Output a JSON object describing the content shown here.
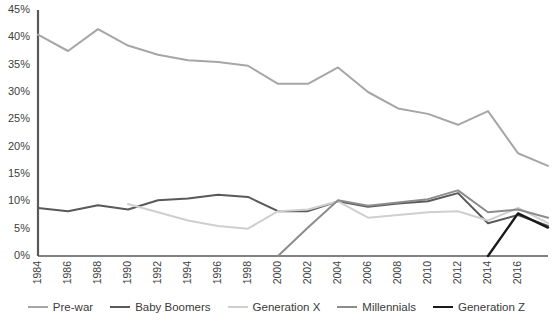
{
  "chart_data": {
    "type": "line",
    "title": "",
    "subtitle": "",
    "xlabel": "",
    "ylabel": "",
    "xlim": [
      1984,
      2018
    ],
    "ylim": [
      0,
      45
    ],
    "grid": false,
    "legend_position": "bottom",
    "y_ticks": [
      "0%",
      "5%",
      "10%",
      "15%",
      "20%",
      "25%",
      "30%",
      "35%",
      "40%",
      "45%"
    ],
    "y_tick_values": [
      0,
      5,
      10,
      15,
      20,
      25,
      30,
      35,
      40,
      45
    ],
    "x_ticks": [
      "1984",
      "1986",
      "1988",
      "1990",
      "1992",
      "1994",
      "1996",
      "1998",
      "2000",
      "2002",
      "2004",
      "2006",
      "2008",
      "2010",
      "2012",
      "2014",
      "2016"
    ],
    "x_tick_values": [
      1984,
      1986,
      1988,
      1990,
      1992,
      1994,
      1996,
      1998,
      2000,
      2002,
      2004,
      2006,
      2008,
      2010,
      2012,
      2014,
      2016
    ],
    "series": [
      {
        "name": "Pre-war",
        "color": "#a6a6a6",
        "width": 2.0,
        "x": [
          1984,
          1986,
          1988,
          1990,
          1992,
          1994,
          1996,
          1998,
          2000,
          2002,
          2004,
          2006,
          2008,
          2010,
          2012,
          2014,
          2016,
          2018
        ],
        "values": [
          40.5,
          37.5,
          41.5,
          38.5,
          36.8,
          35.8,
          35.5,
          34.8,
          31.5,
          31.5,
          34.5,
          30.0,
          27.0,
          26.0,
          24.0,
          26.5,
          18.8,
          16.5
        ]
      },
      {
        "name": "Baby Boomers",
        "color": "#595959",
        "width": 2.0,
        "x": [
          1984,
          1986,
          1988,
          1990,
          1992,
          1994,
          1996,
          1998,
          2000,
          2002,
          2004,
          2006,
          2008,
          2010,
          2012,
          2014,
          2016,
          2018
        ],
        "values": [
          8.8,
          8.2,
          9.3,
          8.5,
          10.2,
          10.5,
          11.2,
          10.8,
          8.2,
          8.2,
          10.0,
          9.0,
          9.6,
          10.0,
          11.5,
          6.0,
          7.5,
          5.5
        ]
      },
      {
        "name": "Generation X",
        "color": "#cfcfcf",
        "width": 2.0,
        "x": [
          1990,
          1992,
          1994,
          1996,
          1998,
          2000,
          2002,
          2004,
          2006,
          2008,
          2010,
          2012,
          2014,
          2016,
          2018
        ],
        "values": [
          9.5,
          8.0,
          6.5,
          5.5,
          5.0,
          8.2,
          8.5,
          10.0,
          7.0,
          7.5,
          8.0,
          8.2,
          6.5,
          8.8,
          6.0
        ]
      },
      {
        "name": "Millennials",
        "color": "#8c8c8c",
        "width": 2.0,
        "x": [
          2000,
          2002,
          2004,
          2006,
          2008,
          2010,
          2012,
          2014,
          2016,
          2018
        ],
        "values": [
          0.0,
          5.2,
          10.2,
          9.2,
          9.8,
          10.4,
          12.0,
          8.0,
          8.5,
          7.0
        ]
      },
      {
        "name": "Generation Z",
        "color": "#1a1a1a",
        "width": 2.4,
        "x": [
          2014,
          2016,
          2018
        ],
        "values": [
          0.0,
          7.8,
          5.2
        ]
      }
    ]
  },
  "legend": {
    "items": [
      {
        "label": "Pre-war",
        "color": "#a6a6a6",
        "width": 2.0
      },
      {
        "label": "Baby Boomers",
        "color": "#595959",
        "width": 2.4
      },
      {
        "label": "Generation X",
        "color": "#cfcfcf",
        "width": 2.0
      },
      {
        "label": "Millennials",
        "color": "#8c8c8c",
        "width": 2.0
      },
      {
        "label": "Generation Z",
        "color": "#1a1a1a",
        "width": 2.6
      }
    ]
  },
  "axis": {
    "line_color": "#595959"
  }
}
